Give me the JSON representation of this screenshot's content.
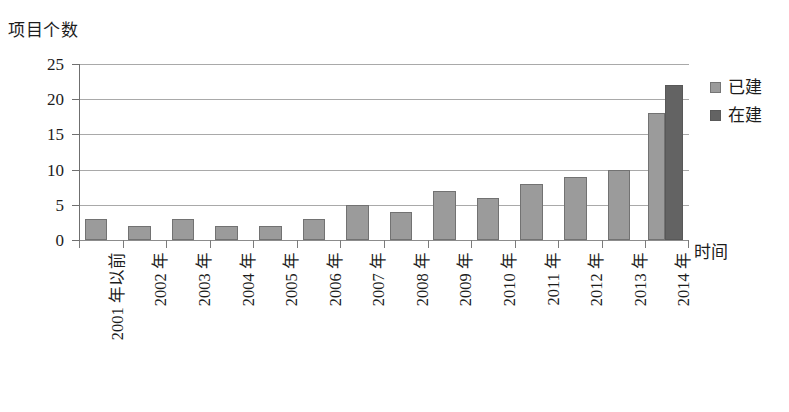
{
  "chart_data": {
    "type": "bar",
    "title": "",
    "subtitle": "",
    "ylabel": "项目个数",
    "xlabel": "时间",
    "ylim": [
      0,
      25
    ],
    "yticks": [
      0,
      5,
      10,
      15,
      20,
      25
    ],
    "grid": true,
    "legend_position": "right",
    "categories": [
      "2001 年以前",
      "2002 年",
      "2003 年",
      "2004 年",
      "2005 年",
      "2006 年",
      "2007 年",
      "2008 年",
      "2009 年",
      "2010 年",
      "2011 年",
      "2012 年",
      "2013 年",
      "2014 年"
    ],
    "series": [
      {
        "name": "已建",
        "color": "#9b9b9b",
        "values": [
          3,
          2,
          3,
          2,
          2,
          3,
          5,
          4,
          7,
          6,
          8,
          9,
          10,
          18
        ]
      },
      {
        "name": "在建",
        "color": "#636363",
        "values": [
          null,
          null,
          null,
          null,
          null,
          null,
          null,
          null,
          null,
          null,
          null,
          null,
          null,
          22
        ]
      }
    ]
  },
  "legend": {
    "items": [
      {
        "label": "已建",
        "color": "#9b9b9b"
      },
      {
        "label": "在建",
        "color": "#636363"
      }
    ]
  },
  "axes": {
    "y_title": "项目个数",
    "x_title": "时间",
    "y_tick_labels": [
      "25",
      "20",
      "15",
      "10",
      "5",
      "0"
    ]
  }
}
